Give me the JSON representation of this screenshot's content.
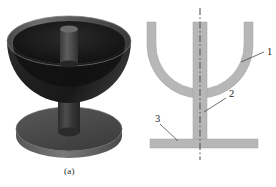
{
  "figure": {
    "background": "#ffffff"
  },
  "panels": [
    {
      "id": "panel-a",
      "caption": "(a)",
      "kind": "3d-render",
      "description": "Shaded three-dimensional rendering of a hemispherical bowl on a cylindrical stem with a circular base disc",
      "parts": [
        {
          "name": "bowl-outer",
          "color": "#1e1e1e"
        },
        {
          "name": "bowl-inner-cavity",
          "color": "#141414"
        },
        {
          "name": "bowl-rim-highlight",
          "color": "#6a6a6a"
        },
        {
          "name": "center-post",
          "color": "#4a4a4a"
        },
        {
          "name": "stem",
          "color": "#3c3c3c"
        },
        {
          "name": "base-disc",
          "color": "#4e4e4e"
        },
        {
          "name": "base-disc-edge",
          "color": "#6e6e6e"
        }
      ]
    },
    {
      "id": "panel-b",
      "caption": "(b)",
      "kind": "cross-section",
      "description": "Two-dimensional sectional schematic with numbered callouts and a dash-dot axis of symmetry",
      "fill_color": "#b7b7b7",
      "centerline_color": "#5a5a5a",
      "leader_color": "#4a4a4a",
      "callouts": [
        {
          "number": "1",
          "target": "bowl-wall",
          "label_x": 268,
          "label_y": 55
        },
        {
          "number": "2",
          "target": "stem-column",
          "label_x": 230,
          "label_y": 96
        },
        {
          "number": "3",
          "target": "base-plate",
          "label_x": 157,
          "label_y": 120
        }
      ],
      "parts": [
        {
          "name": "bowl-wall",
          "callout": "1"
        },
        {
          "name": "stem-column",
          "callout": "2"
        },
        {
          "name": "base-plate",
          "callout": "3"
        },
        {
          "name": "axis-centerline",
          "callout": null
        }
      ]
    }
  ]
}
